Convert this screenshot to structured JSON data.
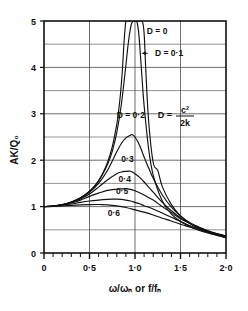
{
  "chart_data": {
    "type": "line",
    "title": "",
    "xlabel": "ω/ωₙ or f/fₙ",
    "ylabel": "AK/Q₀",
    "xlim": [
      0,
      2.0
    ],
    "ylim": [
      0,
      5
    ],
    "grid": true,
    "legend_position": "inline-annotations",
    "x_ticks": [
      0,
      0.5,
      1.0,
      1.5,
      2.0
    ],
    "x_tick_labels": [
      "0",
      "0·5",
      "1·0",
      "1·5",
      "2·0"
    ],
    "x_minor_tick_step": 0.1,
    "y_ticks": [
      0,
      1,
      2,
      3,
      4,
      5
    ],
    "y_tick_labels": [
      "0",
      "1",
      "2",
      "3",
      "4",
      "5"
    ],
    "y_gridline_step": 0.5,
    "annotation_formula": {
      "lhs": "D =",
      "numerator": "c²",
      "denominator": "2k"
    },
    "series": [
      {
        "name": "D = 0",
        "label": "D = 0",
        "D": 0,
        "label_x": 1.13,
        "label_y": 4.72,
        "arrow": false,
        "x": [
          0,
          0.1,
          0.2,
          0.3,
          0.4,
          0.5,
          0.55,
          0.6,
          0.65,
          0.7,
          0.75,
          0.8,
          0.82,
          0.84,
          0.86,
          0.88,
          0.9,
          0.92,
          0.94,
          0.96,
          0.98,
          1.0,
          1.02,
          1.04,
          1.06,
          1.08,
          1.1,
          1.12,
          1.15,
          1.2,
          1.25,
          1.3,
          1.4,
          1.5,
          1.6,
          1.7,
          1.8,
          1.9,
          2.0
        ],
        "y": [
          1.0,
          1.01,
          1.042,
          1.1,
          1.19,
          1.333,
          1.43,
          1.563,
          1.735,
          1.961,
          2.286,
          2.778,
          3.06,
          3.42,
          3.9,
          4.56,
          5.0,
          5.0,
          5.0,
          5.0,
          5.0,
          5.0,
          5.0,
          5.0,
          5.0,
          5.0,
          4.74,
          3.89,
          2.84,
          1.95,
          1.78,
          1.43,
          1.042,
          0.8,
          0.641,
          0.53,
          0.446,
          0.382,
          0.333
        ]
      },
      {
        "name": "D = 0·1",
        "label": "D = 0·1",
        "D": 0.1,
        "label_x": 1.22,
        "label_y": 4.25,
        "arrow": true,
        "arrow_from_x": 1.14,
        "arrow_to_x": 1.08,
        "x": [
          0,
          0.1,
          0.2,
          0.3,
          0.4,
          0.5,
          0.6,
          0.7,
          0.75,
          0.8,
          0.85,
          0.9,
          0.92,
          0.94,
          0.96,
          0.98,
          0.99,
          1.0,
          1.01,
          1.02,
          1.04,
          1.06,
          1.08,
          1.1,
          1.15,
          1.2,
          1.3,
          1.4,
          1.5,
          1.6,
          1.7,
          1.8,
          1.9,
          2.0
        ],
        "y": [
          1.0,
          1.01,
          1.042,
          1.099,
          1.188,
          1.327,
          1.55,
          1.92,
          2.19,
          2.6,
          3.2,
          4.05,
          4.42,
          4.72,
          4.93,
          5.0,
          5.0,
          5.0,
          5.0,
          5.0,
          4.76,
          4.25,
          3.69,
          3.18,
          2.24,
          1.68,
          1.12,
          0.84,
          0.68,
          0.57,
          0.49,
          0.43,
          0.38,
          0.33
        ]
      },
      {
        "name": "D = 0·2",
        "label": "D = 0·2",
        "D": 0.2,
        "label_x": 0.8,
        "label_y": 2.9,
        "arrow": false,
        "peak": {
          "x": 0.97,
          "y": 2.55
        },
        "x": [
          0,
          0.1,
          0.2,
          0.3,
          0.4,
          0.5,
          0.6,
          0.7,
          0.8,
          0.85,
          0.9,
          0.95,
          0.97,
          1.0,
          1.05,
          1.1,
          1.15,
          1.2,
          1.3,
          1.4,
          1.5,
          1.6,
          1.7,
          1.8,
          1.9,
          2.0
        ],
        "y": [
          1.0,
          1.01,
          1.04,
          1.095,
          1.18,
          1.307,
          1.5,
          1.79,
          2.18,
          2.36,
          2.48,
          2.54,
          2.55,
          2.5,
          2.32,
          2.07,
          1.83,
          1.61,
          1.25,
          0.99,
          0.8,
          0.66,
          0.56,
          0.48,
          0.41,
          0.36
        ]
      },
      {
        "name": "0·3",
        "label": "0·3",
        "D": 0.3,
        "label_x": 0.85,
        "label_y": 1.97,
        "arrow": false,
        "peak": {
          "x": 0.93,
          "y": 1.76
        },
        "x": [
          0,
          0.1,
          0.2,
          0.3,
          0.4,
          0.5,
          0.6,
          0.7,
          0.8,
          0.85,
          0.9,
          0.93,
          0.95,
          1.0,
          1.05,
          1.1,
          1.15,
          1.2,
          1.3,
          1.4,
          1.5,
          1.6,
          1.7,
          1.8,
          1.9,
          2.0
        ],
        "y": [
          1.0,
          1.01,
          1.04,
          1.09,
          1.165,
          1.27,
          1.42,
          1.58,
          1.71,
          1.745,
          1.76,
          1.765,
          1.76,
          1.71,
          1.63,
          1.53,
          1.42,
          1.31,
          1.09,
          0.91,
          0.76,
          0.64,
          0.55,
          0.47,
          0.41,
          0.36
        ]
      },
      {
        "name": "0·4",
        "label": "0·4",
        "D": 0.4,
        "label_x": 0.82,
        "label_y": 1.53,
        "arrow": false,
        "peak": {
          "x": 0.88,
          "y": 1.38
        },
        "x": [
          0,
          0.1,
          0.2,
          0.3,
          0.4,
          0.5,
          0.6,
          0.7,
          0.8,
          0.85,
          0.88,
          0.9,
          0.95,
          1.0,
          1.05,
          1.1,
          1.2,
          1.3,
          1.4,
          1.5,
          1.6,
          1.7,
          1.8,
          1.9,
          2.0
        ],
        "y": [
          1.0,
          1.01,
          1.036,
          1.08,
          1.14,
          1.22,
          1.29,
          1.35,
          1.375,
          1.382,
          1.383,
          1.382,
          1.37,
          1.34,
          1.3,
          1.25,
          1.14,
          1.0,
          0.87,
          0.74,
          0.64,
          0.55,
          0.48,
          0.42,
          0.37
        ]
      },
      {
        "name": "0·5",
        "label": "0·5",
        "D": 0.5,
        "label_x": 0.79,
        "label_y": 1.27,
        "arrow": false,
        "peak": {
          "x": 0.8,
          "y": 1.16
        },
        "x": [
          0,
          0.1,
          0.2,
          0.3,
          0.4,
          0.5,
          0.6,
          0.7,
          0.75,
          0.8,
          0.85,
          0.9,
          0.95,
          1.0,
          1.05,
          1.1,
          1.2,
          1.3,
          1.4,
          1.5,
          1.6,
          1.7,
          1.8,
          1.9,
          2.0
        ],
        "y": [
          1.0,
          1.005,
          1.025,
          1.055,
          1.09,
          1.12,
          1.14,
          1.155,
          1.16,
          1.16,
          1.155,
          1.14,
          1.12,
          1.09,
          1.06,
          1.02,
          0.95,
          0.86,
          0.77,
          0.68,
          0.59,
          0.52,
          0.46,
          0.41,
          0.36
        ]
      },
      {
        "name": "0·6",
        "label": "0·6",
        "D": 0.6,
        "label_x": 0.7,
        "label_y": 0.8,
        "arrow": false,
        "peak": {
          "x": 0.62,
          "y": 1.045
        },
        "x": [
          0,
          0.1,
          0.2,
          0.3,
          0.4,
          0.5,
          0.6,
          0.62,
          0.7,
          0.8,
          0.9,
          1.0,
          1.1,
          1.2,
          1.3,
          1.4,
          1.5,
          1.6,
          1.7,
          1.8,
          1.9,
          2.0
        ],
        "y": [
          1.0,
          1.003,
          1.013,
          1.027,
          1.038,
          1.044,
          1.045,
          1.045,
          1.038,
          1.015,
          0.98,
          0.93,
          0.88,
          0.82,
          0.75,
          0.69,
          0.62,
          0.56,
          0.5,
          0.45,
          0.4,
          0.36
        ]
      }
    ]
  }
}
